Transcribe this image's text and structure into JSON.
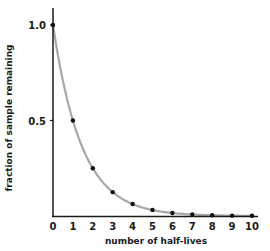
{
  "chart_data": {
    "type": "scatter",
    "title": "",
    "xlabel": "number of half-lives",
    "ylabel": "fraction of sample remaining",
    "x_ticks": [
      "0",
      "1",
      "2",
      "3",
      "4",
      "5",
      "6",
      "7",
      "8",
      "9",
      "10"
    ],
    "y_ticks": [
      "0.5",
      "1.0"
    ],
    "xlim": [
      0,
      10
    ],
    "ylim": [
      0,
      1.0
    ],
    "grid": false,
    "legend": null,
    "series": [
      {
        "name": "data points",
        "x": [
          0,
          1,
          2,
          3,
          4,
          5,
          6,
          7,
          8,
          9,
          10
        ],
        "y": [
          1.0,
          0.5,
          0.25,
          0.125,
          0.0625,
          0.03125,
          0.015625,
          0.0078125,
          0.00390625,
          0.001953125,
          0.0009765625
        ]
      },
      {
        "name": "decay curve",
        "function": "y = 0.5^x",
        "style": "smooth gray line"
      }
    ],
    "colors": {
      "curve": "#a8a8a8",
      "points": "#111111",
      "axis": "#1a1a1a"
    }
  }
}
